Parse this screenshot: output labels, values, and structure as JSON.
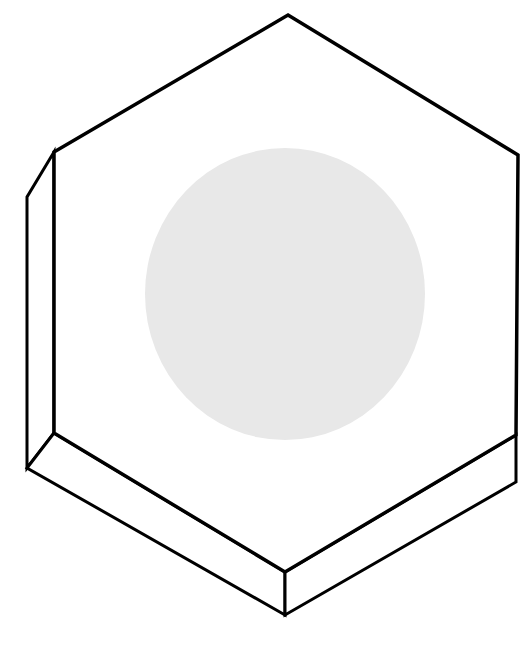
{
  "diagram": {
    "title": "",
    "colors": {
      "background": "#ffffff",
      "stroke": "#000000",
      "circle_fill": "#e8e8e8"
    },
    "top_face": {
      "points": "288,15 518,155 516,435 285,572 54,433 54,152"
    },
    "side_faces": {
      "left_outer": "54,152 27,197 27,468 54,433",
      "bottom_left": "54,433 27,468 285,615 285,572",
      "bottom_right": "285,572 285,615 516,482 516,435"
    },
    "circle": {
      "cx": 285,
      "cy": 294,
      "rx": 140,
      "ry": 146
    }
  }
}
